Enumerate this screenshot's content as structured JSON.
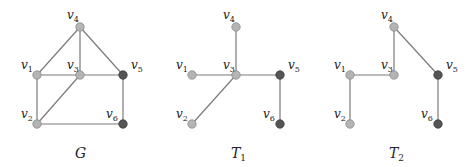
{
  "graphs": [
    {
      "id": "G",
      "caption": {
        "main": "G",
        "sub": ""
      },
      "vertices": [
        {
          "id": "v1",
          "name": "v",
          "sub": "1",
          "shade": "light"
        },
        {
          "id": "v2",
          "name": "v",
          "sub": "2",
          "shade": "light"
        },
        {
          "id": "v3",
          "name": "v",
          "sub": "3",
          "shade": "light"
        },
        {
          "id": "v4",
          "name": "v",
          "sub": "4",
          "shade": "light"
        },
        {
          "id": "v5",
          "name": "v",
          "sub": "5",
          "shade": "dark"
        },
        {
          "id": "v6",
          "name": "v",
          "sub": "6",
          "shade": "dark"
        }
      ],
      "edges": [
        [
          "v4",
          "v1"
        ],
        [
          "v4",
          "v3"
        ],
        [
          "v4",
          "v5"
        ],
        [
          "v1",
          "v3"
        ],
        [
          "v3",
          "v5"
        ],
        [
          "v1",
          "v2"
        ],
        [
          "v3",
          "v2"
        ],
        [
          "v2",
          "v6"
        ],
        [
          "v5",
          "v6"
        ]
      ]
    },
    {
      "id": "T1",
      "caption": {
        "main": "T",
        "sub": "1"
      },
      "vertices": [
        {
          "id": "v1",
          "name": "v",
          "sub": "1",
          "shade": "light"
        },
        {
          "id": "v2",
          "name": "v",
          "sub": "2",
          "shade": "light"
        },
        {
          "id": "v3",
          "name": "v",
          "sub": "3",
          "shade": "light"
        },
        {
          "id": "v4",
          "name": "v",
          "sub": "4",
          "shade": "light"
        },
        {
          "id": "v5",
          "name": "v",
          "sub": "5",
          "shade": "dark"
        },
        {
          "id": "v6",
          "name": "v",
          "sub": "6",
          "shade": "dark"
        }
      ],
      "edges": [
        [
          "v4",
          "v3"
        ],
        [
          "v1",
          "v3"
        ],
        [
          "v3",
          "v5"
        ],
        [
          "v3",
          "v2"
        ],
        [
          "v5",
          "v6"
        ]
      ]
    },
    {
      "id": "T2",
      "caption": {
        "main": "T",
        "sub": "2"
      },
      "vertices": [
        {
          "id": "v1",
          "name": "v",
          "sub": "1",
          "shade": "light"
        },
        {
          "id": "v2",
          "name": "v",
          "sub": "2",
          "shade": "light"
        },
        {
          "id": "v3",
          "name": "v",
          "sub": "3",
          "shade": "light"
        },
        {
          "id": "v4",
          "name": "v",
          "sub": "4",
          "shade": "light"
        },
        {
          "id": "v5",
          "name": "v",
          "sub": "5",
          "shade": "dark"
        },
        {
          "id": "v6",
          "name": "v",
          "sub": "6",
          "shade": "dark"
        }
      ],
      "edges": [
        [
          "v4",
          "v3"
        ],
        [
          "v4",
          "v5"
        ],
        [
          "v1",
          "v3"
        ],
        [
          "v1",
          "v2"
        ],
        [
          "v5",
          "v6"
        ]
      ]
    }
  ],
  "colors": {
    "light_vertex": "#b4b4b4",
    "dark_vertex": "#555555",
    "edge": "#7a7a7a"
  }
}
